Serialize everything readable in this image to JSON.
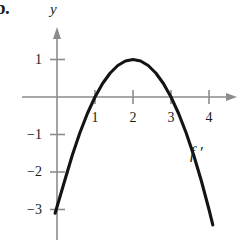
{
  "problem": {
    "label": "b."
  },
  "chart_data": {
    "type": "line",
    "title": "",
    "subtitle": "",
    "xlabel": "",
    "ylabel": "y",
    "axis_label_y": "y",
    "curve_label": "f ′",
    "grid": false,
    "legend_position": "inline-annotation",
    "xlim": [
      -0.9,
      4.8
    ],
    "ylim": [
      -4.0,
      1.8
    ],
    "x_ticks": [
      1,
      2,
      3,
      4
    ],
    "x_tick_labels": [
      "1",
      "2",
      "3",
      "4"
    ],
    "y_ticks": [
      1,
      -1,
      -2,
      -3
    ],
    "y_tick_labels": [
      "1",
      "−1",
      "−2",
      "−3"
    ],
    "function": "f'(x) = -(x - 2)^2 + 1",
    "roots": [
      1,
      3
    ],
    "vertex": {
      "x": 2,
      "y": 1
    },
    "series": [
      {
        "name": "f ′",
        "x": [
          -0.05,
          0.2,
          0.4,
          0.6,
          0.8,
          1.0,
          1.2,
          1.4,
          1.6,
          1.8,
          2.0,
          2.2,
          2.4,
          2.6,
          2.8,
          3.0,
          3.2,
          3.4,
          3.6,
          3.8,
          4.0,
          4.1
        ],
        "values": [
          -3.1,
          -2.24,
          -1.56,
          -0.96,
          -0.44,
          0.0,
          0.36,
          0.64,
          0.84,
          0.96,
          1.0,
          0.96,
          0.84,
          0.64,
          0.36,
          0.0,
          -0.44,
          -0.96,
          -1.56,
          -2.24,
          -3.0,
          -3.41
        ]
      }
    ]
  },
  "axes": {
    "x_axis_name": "",
    "y_axis_name": "y",
    "x_arrow": "right-arrow",
    "y_arrow": "up-arrow"
  },
  "colors": {
    "curve": "#141414",
    "axis": "#8c8c8c",
    "text": "#1b1b1b",
    "background": "#ffffff"
  }
}
